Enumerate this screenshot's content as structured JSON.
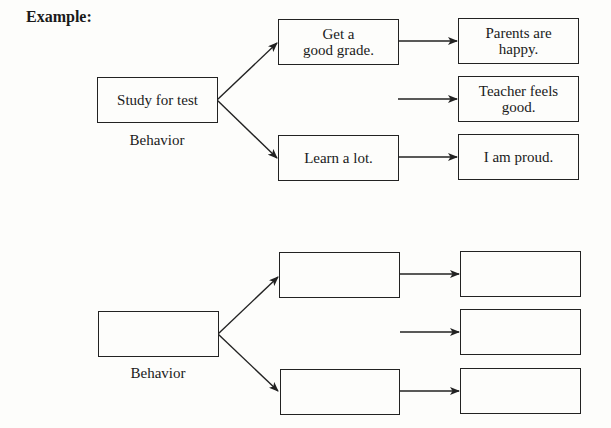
{
  "title": "Example:",
  "example": {
    "behavior_box": "Study for test",
    "behavior_label": "Behavior",
    "outcomes": [
      {
        "text": "Get a\ngood grade.",
        "consequences": [
          "Parents are\nhappy.",
          "Teacher feels\ngood."
        ]
      },
      {
        "text": "Learn a lot.",
        "consequences": [
          "I am proud."
        ]
      }
    ],
    "cells": {
      "mid_top": "Get a\ngood grade.",
      "mid_bottom": "Learn a lot.",
      "right_1": "Parents are\nhappy.",
      "right_2": "Teacher feels\ngood.",
      "right_3": "I am proud."
    }
  },
  "blank": {
    "behavior_box": "",
    "behavior_label": "Behavior",
    "cells": {
      "mid_top": "",
      "mid_bottom": "",
      "right_1": "",
      "right_2": "",
      "right_3": ""
    }
  },
  "colors": {
    "line": "#222222",
    "background": "#fdfdfb"
  }
}
